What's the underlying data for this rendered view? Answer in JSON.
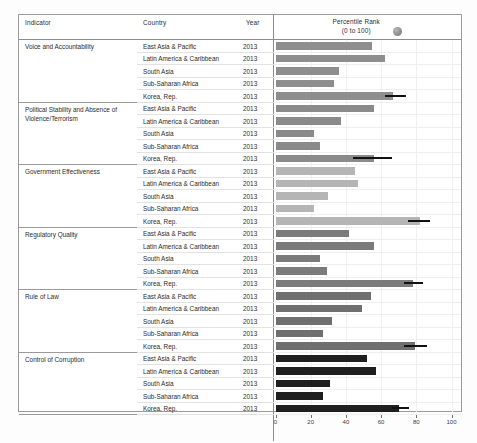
{
  "table": {
    "columns": {
      "indicator": "Indicator",
      "country": "Country",
      "year": "Year",
      "chart_title_line1": "Percentile Rank",
      "chart_title_line2": "(0 to 100)",
      "chart_badge_icon": "sphere-badge-icon"
    }
  },
  "chart_data": {
    "type": "bar",
    "title": "Percentile Rank (0 to 100)",
    "xlabel": "",
    "ylabel": "",
    "xlim": [
      0,
      100
    ],
    "xticks": [
      0,
      20,
      40,
      60,
      80,
      100
    ],
    "xtick_labels": [
      "0",
      "20",
      "40",
      "60",
      "80",
      "100"
    ],
    "grid": true,
    "legend_position": "none",
    "orientation": "horizontal",
    "categories": [
      "East Asia & Pacific",
      "Latin America & Caribbean",
      "South Asia",
      "Sub-Saharan Africa",
      "Korea, Rep."
    ],
    "groups": [
      {
        "indicator": "Voice and Accountability",
        "year": "2013",
        "color": "#8e8e8e",
        "values": [
          55,
          62,
          36,
          33,
          67
        ],
        "error_marker": {
          "category": "Korea, Rep.",
          "from": 62,
          "to": 74
        }
      },
      {
        "indicator": "Political Stability and Absence of Violence/Terrorism",
        "year": "2013",
        "color": "#8a8a8a",
        "values": [
          56,
          37,
          22,
          25,
          56
        ],
        "error_marker": {
          "category": "Korea, Rep.",
          "from": 44,
          "to": 66
        }
      },
      {
        "indicator": "Government Effectiveness",
        "year": "2013",
        "color": "#b5b5b5",
        "values": [
          45,
          47,
          30,
          22,
          82
        ],
        "error_marker": {
          "category": "Korea, Rep.",
          "from": 75,
          "to": 88
        }
      },
      {
        "indicator": "Regulatory Quality",
        "year": "2013",
        "color": "#7b7b7b",
        "values": [
          42,
          56,
          25,
          29,
          78
        ],
        "error_marker": {
          "category": "Korea, Rep.",
          "from": 73,
          "to": 84
        }
      },
      {
        "indicator": "Rule of Law",
        "year": "2013",
        "color": "#6f6f6f",
        "values": [
          54,
          49,
          32,
          27,
          79
        ],
        "error_marker": {
          "category": "Korea, Rep.",
          "from": 73,
          "to": 86
        }
      },
      {
        "indicator": "Control of Corruption",
        "year": "2013",
        "color": "#1f1f1f",
        "values": [
          52,
          57,
          31,
          27,
          70
        ],
        "error_marker": {
          "category": "Korea, Rep.",
          "from": 66,
          "to": 76
        }
      }
    ]
  }
}
